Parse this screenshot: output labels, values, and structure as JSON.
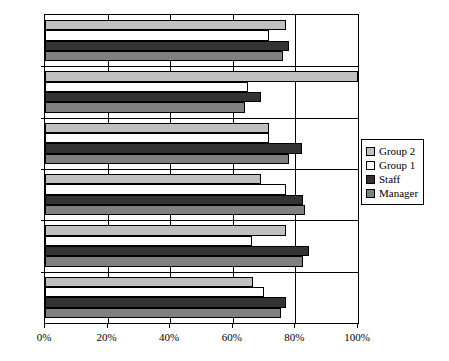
{
  "chart_data": {
    "type": "bar",
    "orientation": "horizontal",
    "title": "",
    "subtitle": "",
    "xlabel": "",
    "ylabel": "",
    "xlim": [
      0,
      100
    ],
    "xticks": [
      0,
      20,
      40,
      60,
      80,
      100
    ],
    "xtick_labels": [
      "0%",
      "20%",
      "40%",
      "60%",
      "80%",
      "100%"
    ],
    "grid": true,
    "grid_axis": "x",
    "legend_position": "right",
    "categories": [
      "M34",
      "M55",
      "M5",
      "M45",
      "M36",
      "M27"
    ],
    "series": [
      {
        "name": "Group 2",
        "color": "#c0c0c0",
        "values": [
          77,
          100,
          71.5,
          69,
          77,
          66.5
        ]
      },
      {
        "name": "Group 1",
        "color": "#ffffff",
        "values": [
          71.5,
          65,
          71.5,
          77,
          66,
          70
        ]
      },
      {
        "name": "Staff",
        "color": "#333333",
        "values": [
          78,
          69,
          82,
          82.5,
          84.5,
          77
        ]
      },
      {
        "name": "Manager",
        "color": "#808080",
        "values": [
          76,
          64,
          78,
          83,
          82.5,
          75.5
        ]
      }
    ]
  },
  "legend": {
    "items": [
      {
        "label": "Group 2",
        "swatch": "group2"
      },
      {
        "label": "Group 1",
        "swatch": "group1"
      },
      {
        "label": "Staff",
        "swatch": "staff"
      },
      {
        "label": "Manager",
        "swatch": "manager"
      }
    ]
  },
  "axes": {
    "x_tick_labels": [
      "0%",
      "20%",
      "40%",
      "60%",
      "80%",
      "100%"
    ],
    "y_tick_labels": [
      "M34",
      "M55",
      "M5",
      "M45",
      "M36",
      "M27"
    ]
  },
  "colors": {
    "group2": "#c0c0c0",
    "group1": "#ffffff",
    "staff": "#333333",
    "manager": "#808080",
    "axis": "#000000",
    "background": "#ffffff"
  }
}
